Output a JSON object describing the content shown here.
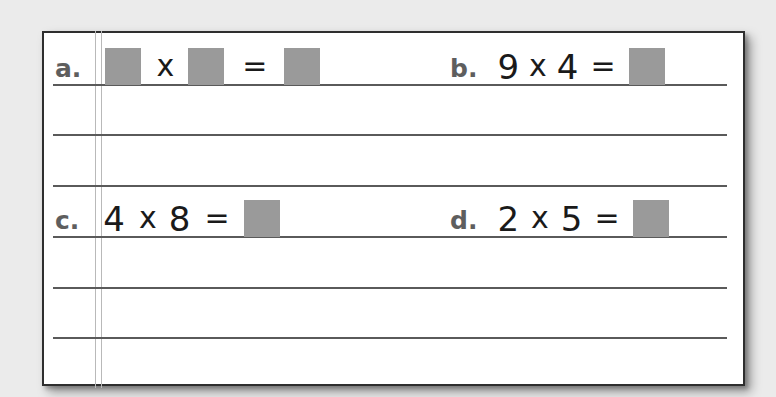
{
  "worksheet": {
    "colors": {
      "background": "#ebebeb",
      "paper": "#ffffff",
      "border": "#2e2e2e",
      "rule_line": "#5a5a5a",
      "margin_line": "#b9b9b9",
      "answer_box": "#9a9a9a",
      "label": "#5e5e5e",
      "text": "#1a1a1a"
    },
    "problems": [
      {
        "label": "a.",
        "left": "",
        "operator": "x",
        "right": "",
        "equals": "=",
        "answer": "",
        "left_blank": true,
        "right_blank": true
      },
      {
        "label": "b.",
        "left": "9",
        "operator": "x",
        "right": "4",
        "equals": "=",
        "answer": ""
      },
      {
        "label": "c.",
        "left": "4",
        "operator": "x",
        "right": "8",
        "equals": "=",
        "answer": ""
      },
      {
        "label": "d.",
        "left": "2",
        "operator": "x",
        "right": "5",
        "equals": "=",
        "answer": ""
      }
    ]
  }
}
